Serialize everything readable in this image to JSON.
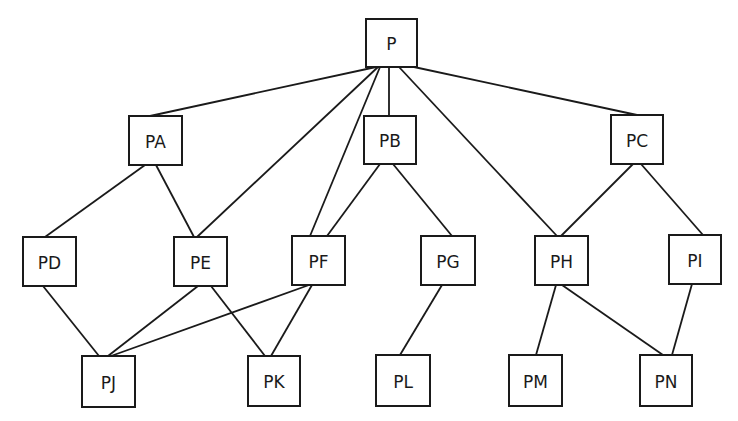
{
  "diagram": {
    "type": "hierarchy-graph",
    "colors": {
      "stroke": "#1a1a1a",
      "background": "#ffffff",
      "box_fill": "#ffffff"
    },
    "nodes": [
      {
        "id": "P",
        "label": "P",
        "x": 366,
        "y": 19,
        "w": 51,
        "h": 48
      },
      {
        "id": "PA",
        "label": "PA",
        "x": 129,
        "y": 116,
        "w": 53,
        "h": 49
      },
      {
        "id": "PB",
        "label": "PB",
        "x": 364,
        "y": 116,
        "w": 52,
        "h": 48
      },
      {
        "id": "PC",
        "label": "PC",
        "x": 611,
        "y": 115,
        "w": 52,
        "h": 49
      },
      {
        "id": "PD",
        "label": "PD",
        "x": 23,
        "y": 237,
        "w": 53,
        "h": 49
      },
      {
        "id": "PE",
        "label": "PE",
        "x": 174,
        "y": 237,
        "w": 53,
        "h": 49
      },
      {
        "id": "PF",
        "label": "PF",
        "x": 292,
        "y": 236,
        "w": 53,
        "h": 49
      },
      {
        "id": "PG",
        "label": "PG",
        "x": 421,
        "y": 236,
        "w": 54,
        "h": 49
      },
      {
        "id": "PH",
        "label": "PH",
        "x": 535,
        "y": 236,
        "w": 53,
        "h": 49
      },
      {
        "id": "PI",
        "label": "PI",
        "x": 669,
        "y": 235,
        "w": 52,
        "h": 49
      },
      {
        "id": "PJ",
        "label": "PJ",
        "x": 82,
        "y": 356,
        "w": 53,
        "h": 51
      },
      {
        "id": "PK",
        "label": "PK",
        "x": 248,
        "y": 356,
        "w": 52,
        "h": 50
      },
      {
        "id": "PL",
        "label": "PL",
        "x": 376,
        "y": 355,
        "w": 54,
        "h": 51
      },
      {
        "id": "PM",
        "label": "PM",
        "x": 509,
        "y": 355,
        "w": 53,
        "h": 51
      },
      {
        "id": "PN",
        "label": "PN",
        "x": 640,
        "y": 355,
        "w": 52,
        "h": 51
      }
    ],
    "edges": [
      {
        "from": "P",
        "to": "PA",
        "x1": 376,
        "y1": 67,
        "x2": 150,
        "y2": 116
      },
      {
        "from": "P",
        "to": "PE",
        "x1": 378,
        "y1": 67,
        "x2": 197,
        "y2": 237
      },
      {
        "from": "P",
        "to": "PF",
        "x1": 380,
        "y1": 67,
        "x2": 310,
        "y2": 236
      },
      {
        "from": "P",
        "to": "PB",
        "x1": 389,
        "y1": 67,
        "x2": 389,
        "y2": 116
      },
      {
        "from": "P",
        "to": "PH",
        "x1": 399,
        "y1": 67,
        "x2": 557,
        "y2": 236
      },
      {
        "from": "P",
        "to": "PC",
        "x1": 414,
        "y1": 67,
        "x2": 637,
        "y2": 115
      },
      {
        "from": "PA",
        "to": "PD",
        "x1": 145,
        "y1": 165,
        "x2": 45,
        "y2": 237
      },
      {
        "from": "PA",
        "to": "PE",
        "x1": 156,
        "y1": 165,
        "x2": 194,
        "y2": 237
      },
      {
        "from": "PB",
        "to": "PF",
        "x1": 380,
        "y1": 164,
        "x2": 327,
        "y2": 236
      },
      {
        "from": "PB",
        "to": "PG",
        "x1": 393,
        "y1": 164,
        "x2": 452,
        "y2": 236
      },
      {
        "from": "PC",
        "to": "PH",
        "x1": 633,
        "y1": 164,
        "x2": 561,
        "y2": 236
      },
      {
        "from": "PC",
        "to": "PI",
        "x1": 641,
        "y1": 164,
        "x2": 703,
        "y2": 235
      },
      {
        "from": "PD",
        "to": "PJ",
        "x1": 43,
        "y1": 286,
        "x2": 99,
        "y2": 356
      },
      {
        "from": "PE",
        "to": "PJ",
        "x1": 198,
        "y1": 286,
        "x2": 108,
        "y2": 356
      },
      {
        "from": "PE",
        "to": "PK",
        "x1": 211,
        "y1": 286,
        "x2": 265,
        "y2": 356
      },
      {
        "from": "PF",
        "to": "PJ",
        "x1": 309,
        "y1": 285,
        "x2": 111,
        "y2": 356
      },
      {
        "from": "PF",
        "to": "PK",
        "x1": 312,
        "y1": 285,
        "x2": 271,
        "y2": 356
      },
      {
        "from": "PG",
        "to": "PL",
        "x1": 442,
        "y1": 285,
        "x2": 400,
        "y2": 355
      },
      {
        "from": "PH",
        "to": "PM",
        "x1": 556,
        "y1": 285,
        "x2": 536,
        "y2": 355
      },
      {
        "from": "PH",
        "to": "PN",
        "x1": 562,
        "y1": 285,
        "x2": 663,
        "y2": 355
      },
      {
        "from": "PI",
        "to": "PN",
        "x1": 692,
        "y1": 284,
        "x2": 672,
        "y2": 355
      }
    ]
  }
}
